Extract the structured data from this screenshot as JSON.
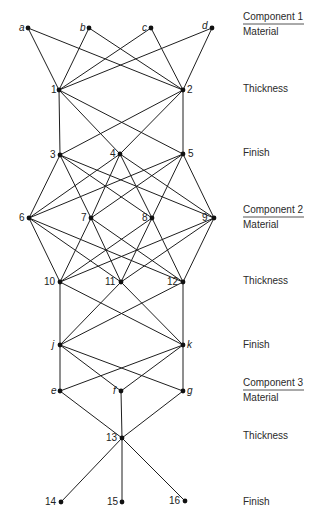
{
  "nodes": [
    {
      "id": "a",
      "label": "a",
      "x": 28,
      "y": 28,
      "italic": true,
      "lx": -9,
      "ly": 3
    },
    {
      "id": "b",
      "label": "b",
      "x": 89,
      "y": 28,
      "italic": true,
      "lx": -9,
      "ly": 3
    },
    {
      "id": "c",
      "label": "c",
      "x": 151,
      "y": 28,
      "italic": true,
      "lx": -9,
      "ly": 3
    },
    {
      "id": "d",
      "label": "d",
      "x": 212,
      "y": 28,
      "italic": true,
      "lx": -10,
      "ly": 1
    },
    {
      "id": "1",
      "label": "1",
      "x": 59,
      "y": 90,
      "italic": false,
      "lx": -8,
      "ly": 3
    },
    {
      "id": "2",
      "label": "2",
      "x": 183,
      "y": 90,
      "italic": false,
      "lx": 4,
      "ly": 3
    },
    {
      "id": "3",
      "label": "3",
      "x": 60,
      "y": 155,
      "italic": false,
      "lx": -10,
      "ly": 3
    },
    {
      "id": "4",
      "label": "4",
      "x": 120,
      "y": 154,
      "italic": false,
      "lx": -10,
      "ly": 3
    },
    {
      "id": "5",
      "label": "5",
      "x": 183,
      "y": 154,
      "italic": false,
      "lx": 5,
      "ly": 3
    },
    {
      "id": "6",
      "label": "6",
      "x": 29,
      "y": 218,
      "italic": false,
      "lx": -10,
      "ly": 3
    },
    {
      "id": "7",
      "label": "7",
      "x": 91,
      "y": 218,
      "italic": false,
      "lx": -10,
      "ly": 3
    },
    {
      "id": "8",
      "label": "8",
      "x": 152,
      "y": 218,
      "italic": false,
      "lx": -10,
      "ly": 3
    },
    {
      "id": "9",
      "label": "9",
      "x": 214,
      "y": 218,
      "italic": false,
      "lx": -12,
      "ly": 3
    },
    {
      "id": "10",
      "label": "10",
      "x": 60,
      "y": 282,
      "italic": false,
      "lx": -16,
      "ly": 3
    },
    {
      "id": "11",
      "label": "11",
      "x": 121,
      "y": 282,
      "italic": false,
      "lx": -16,
      "ly": 3
    },
    {
      "id": "12",
      "label": "12",
      "x": 183,
      "y": 282,
      "italic": false,
      "lx": -16,
      "ly": 3
    },
    {
      "id": "j",
      "label": "j",
      "x": 60,
      "y": 345,
      "italic": true,
      "lx": -8,
      "ly": 3
    },
    {
      "id": "k",
      "label": "k",
      "x": 183,
      "y": 345,
      "italic": true,
      "lx": 4,
      "ly": 3
    },
    {
      "id": "e",
      "label": "e",
      "x": 60,
      "y": 391,
      "italic": true,
      "lx": -9,
      "ly": 3
    },
    {
      "id": "f",
      "label": "f",
      "x": 121,
      "y": 391,
      "italic": true,
      "lx": -8,
      "ly": 3
    },
    {
      "id": "g",
      "label": "g",
      "x": 183,
      "y": 391,
      "italic": true,
      "lx": 4,
      "ly": 3
    },
    {
      "id": "13",
      "label": "13",
      "x": 122,
      "y": 438,
      "italic": false,
      "lx": -16,
      "ly": 3
    },
    {
      "id": "14",
      "label": "14",
      "x": 61,
      "y": 502,
      "italic": false,
      "lx": -16,
      "ly": 3
    },
    {
      "id": "15",
      "label": "15",
      "x": 122,
      "y": 502,
      "italic": false,
      "lx": -15,
      "ly": 3
    },
    {
      "id": "16",
      "label": "16",
      "x": 185,
      "y": 501,
      "italic": false,
      "lx": -16,
      "ly": 3
    }
  ],
  "layers": [
    [
      "a",
      "b",
      "c",
      "d"
    ],
    [
      "1",
      "2"
    ],
    [
      "3",
      "4",
      "5"
    ],
    [
      "6",
      "7",
      "8",
      "9"
    ],
    [
      "10",
      "11",
      "12"
    ],
    [
      "j",
      "k"
    ],
    [
      "e",
      "f",
      "g"
    ],
    [
      "13"
    ],
    [
      "14",
      "15",
      "16"
    ]
  ],
  "edge_rule": "complete bipartite between consecutive layers",
  "stage_labels": [
    {
      "text": "Component 1",
      "y": 20,
      "underline": true
    },
    {
      "text": "Material",
      "y": 35,
      "underline": false
    },
    {
      "text": "Thickness",
      "y": 92,
      "underline": false
    },
    {
      "text": "Finish",
      "y": 156,
      "underline": false
    },
    {
      "text": "Component 2",
      "y": 213,
      "underline": true
    },
    {
      "text": "Material",
      "y": 228,
      "underline": false
    },
    {
      "text": "Thickness",
      "y": 284,
      "underline": false
    },
    {
      "text": "Finish",
      "y": 348,
      "underline": false
    },
    {
      "text": "Component 3",
      "y": 386,
      "underline": true
    },
    {
      "text": "Material",
      "y": 401,
      "underline": false
    },
    {
      "text": "Thickness",
      "y": 439,
      "underline": false
    },
    {
      "text": "Finish",
      "y": 505,
      "underline": false
    }
  ],
  "colors": {
    "line": "#1e1e1e",
    "node": "#111111",
    "text": "#222222"
  }
}
